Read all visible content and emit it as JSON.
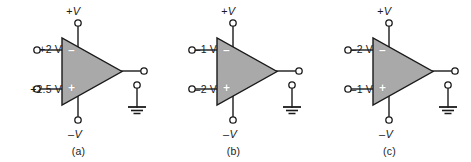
{
  "figure": {
    "name": "op-amp-comparator-figure",
    "background_color": "#ffffff",
    "stroke_color": "#1a1a1a",
    "triangle_fill": "#a9a9a9",
    "terminal_fill": "#ffffff"
  },
  "symbols": {
    "inverting_sign": "–",
    "noninverting_sign": "+",
    "supply_positive_label": "+V",
    "supply_negative_label": "–V",
    "ground_label": ""
  },
  "circuits": [
    {
      "id": "a",
      "caption": "(a)",
      "supply_positive": "+V",
      "supply_negative": "–V",
      "inverting_input_label": "+2 V",
      "noninverting_input_label": "+2.5 V",
      "inverting_sign": "–",
      "noninverting_sign": "+"
    },
    {
      "id": "b",
      "caption": "(b)",
      "supply_positive": "+V",
      "supply_negative": "–V",
      "inverting_input_label": "–1 V",
      "noninverting_input_label": "–2 V",
      "inverting_sign": "–",
      "noninverting_sign": "+"
    },
    {
      "id": "c",
      "caption": "(c)",
      "supply_positive": "+V",
      "supply_negative": "–V",
      "inverting_input_label": "–2 V",
      "noninverting_input_label": "–1 V",
      "inverting_sign": "–",
      "noninverting_sign": "+"
    }
  ]
}
